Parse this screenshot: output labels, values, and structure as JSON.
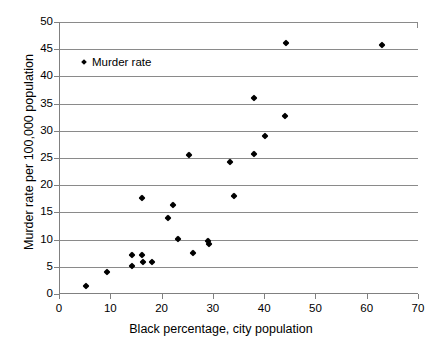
{
  "chart_data": {
    "type": "scatter",
    "title": "",
    "xlabel": "Black percentage, city population",
    "ylabel": "Murder rate per 100,000 population",
    "xlim": [
      0,
      70
    ],
    "ylim": [
      0,
      50
    ],
    "xticks": [
      0,
      10,
      20,
      30,
      40,
      50,
      60,
      70
    ],
    "yticks": [
      0,
      5,
      10,
      15,
      20,
      25,
      30,
      35,
      40,
      45,
      50
    ],
    "grid": "horizontal",
    "legend_position": "top-left",
    "series": [
      {
        "name": "Murder rate",
        "marker": "diamond",
        "color": "#000000",
        "points": [
          [
            5.0,
            1.5
          ],
          [
            9.2,
            4.0
          ],
          [
            14.0,
            7.2
          ],
          [
            14.1,
            5.1
          ],
          [
            16.0,
            7.1
          ],
          [
            16.2,
            5.9
          ],
          [
            18.0,
            5.8
          ],
          [
            15.9,
            17.7
          ],
          [
            21.0,
            14.0
          ],
          [
            22.1,
            16.3
          ],
          [
            23.1,
            10.2
          ],
          [
            25.1,
            25.6
          ],
          [
            26.0,
            7.5
          ],
          [
            28.9,
            9.7
          ],
          [
            29.0,
            9.2
          ],
          [
            33.2,
            24.2
          ],
          [
            34.0,
            18.0
          ],
          [
            37.8,
            36.1
          ],
          [
            37.9,
            25.8
          ],
          [
            39.9,
            29.0
          ],
          [
            43.9,
            32.8
          ],
          [
            44.0,
            46.2
          ],
          [
            62.8,
            45.7
          ]
        ]
      }
    ]
  },
  "legend": {
    "entries": [
      {
        "label": "Murder rate"
      }
    ]
  },
  "axes": {
    "x": {
      "title": "Black percentage, city population",
      "tick_labels": [
        "0",
        "10",
        "20",
        "30",
        "40",
        "50",
        "60",
        "70"
      ]
    },
    "y": {
      "title": "Murder rate per 100,000 population",
      "tick_labels": [
        "0",
        "5",
        "10",
        "15",
        "20",
        "25",
        "30",
        "35",
        "40",
        "45",
        "50"
      ]
    }
  }
}
